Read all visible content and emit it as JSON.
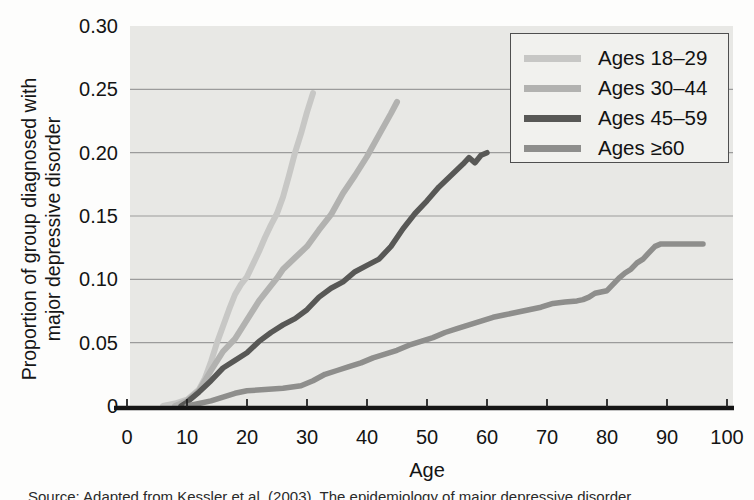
{
  "figure": {
    "y_axis_title_line1": "Proportion of group diagnosed with",
    "y_axis_title_line2": "major depressive disorder",
    "x_axis_title": "Age",
    "caption": "Source: Adapted from Kessler et al. (2003). The epidemiology of major depressive disorder."
  },
  "chart_data": {
    "type": "line",
    "title": "",
    "xlabel": "Age",
    "ylabel": "Proportion of group diagnosed with major depressive disorder",
    "xlim": [
      0,
      100
    ],
    "ylim": [
      0,
      0.3
    ],
    "x_ticks": [
      0,
      10,
      20,
      30,
      40,
      50,
      60,
      70,
      80,
      90,
      100
    ],
    "x_tick_labels": [
      "0",
      "10",
      "20",
      "30",
      "40",
      "50",
      "60",
      "70",
      "80",
      "90",
      "100"
    ],
    "y_ticks": [
      0,
      0.05,
      0.1,
      0.15,
      0.2,
      0.25,
      0.3
    ],
    "y_tick_labels": [
      "0",
      "0.05",
      "0.10",
      "0.15",
      "0.20",
      "0.25",
      "0.30"
    ],
    "grid": "horizontal",
    "legend_position": "top-right",
    "colors": {
      "plot_bg": "#e8e8e5",
      "grid": "#9b9b9b",
      "axis": "#151515",
      "tick": "#222222"
    },
    "series": [
      {
        "name": "Ages 18–29",
        "color": "#c7c7c5",
        "stroke_width": 6,
        "points": [
          [
            6,
            0
          ],
          [
            8,
            0.002
          ],
          [
            10,
            0.005
          ],
          [
            12,
            0.013
          ],
          [
            13,
            0.022
          ],
          [
            14,
            0.035
          ],
          [
            15,
            0.05
          ],
          [
            16,
            0.063
          ],
          [
            17,
            0.076
          ],
          [
            18,
            0.088
          ],
          [
            19,
            0.096
          ],
          [
            20,
            0.102
          ],
          [
            21,
            0.112
          ],
          [
            22,
            0.122
          ],
          [
            23,
            0.133
          ],
          [
            24,
            0.143
          ],
          [
            25,
            0.152
          ],
          [
            26,
            0.165
          ],
          [
            27,
            0.182
          ],
          [
            28,
            0.2
          ],
          [
            29,
            0.215
          ],
          [
            30,
            0.232
          ],
          [
            31,
            0.247
          ]
        ]
      },
      {
        "name": "Ages 30–44",
        "color": "#b2b2b0",
        "stroke_width": 6,
        "points": [
          [
            8,
            0
          ],
          [
            10,
            0.004
          ],
          [
            12,
            0.012
          ],
          [
            14,
            0.028
          ],
          [
            16,
            0.043
          ],
          [
            18,
            0.053
          ],
          [
            20,
            0.068
          ],
          [
            22,
            0.083
          ],
          [
            24,
            0.095
          ],
          [
            25,
            0.101
          ],
          [
            26,
            0.108
          ],
          [
            28,
            0.117
          ],
          [
            30,
            0.126
          ],
          [
            32,
            0.139
          ],
          [
            34,
            0.151
          ],
          [
            36,
            0.168
          ],
          [
            38,
            0.182
          ],
          [
            40,
            0.197
          ],
          [
            42,
            0.214
          ],
          [
            44,
            0.231
          ],
          [
            45,
            0.24
          ]
        ]
      },
      {
        "name": "Ages 45–59",
        "color": "#585856",
        "stroke_width": 5.5,
        "points": [
          [
            9,
            0
          ],
          [
            10,
            0.003
          ],
          [
            12,
            0.011
          ],
          [
            14,
            0.02
          ],
          [
            16,
            0.03
          ],
          [
            18,
            0.036
          ],
          [
            20,
            0.042
          ],
          [
            22,
            0.051
          ],
          [
            24,
            0.058
          ],
          [
            26,
            0.064
          ],
          [
            28,
            0.069
          ],
          [
            30,
            0.076
          ],
          [
            32,
            0.086
          ],
          [
            34,
            0.093
          ],
          [
            36,
            0.098
          ],
          [
            38,
            0.106
          ],
          [
            40,
            0.111
          ],
          [
            42,
            0.116
          ],
          [
            44,
            0.126
          ],
          [
            46,
            0.14
          ],
          [
            48,
            0.152
          ],
          [
            50,
            0.162
          ],
          [
            52,
            0.173
          ],
          [
            54,
            0.182
          ],
          [
            56,
            0.191
          ],
          [
            57,
            0.196
          ],
          [
            58,
            0.192
          ],
          [
            59,
            0.198
          ],
          [
            60,
            0.2
          ]
        ]
      },
      {
        "name": "Ages ≥60",
        "color": "#8e8e8c",
        "stroke_width": 5.5,
        "points": [
          [
            10,
            0
          ],
          [
            12,
            0.002
          ],
          [
            14,
            0.004
          ],
          [
            16,
            0.007
          ],
          [
            18,
            0.01
          ],
          [
            20,
            0.012
          ],
          [
            23,
            0.013
          ],
          [
            26,
            0.014
          ],
          [
            29,
            0.016
          ],
          [
            31,
            0.02
          ],
          [
            33,
            0.025
          ],
          [
            35,
            0.028
          ],
          [
            37,
            0.031
          ],
          [
            39,
            0.034
          ],
          [
            41,
            0.038
          ],
          [
            43,
            0.041
          ],
          [
            45,
            0.044
          ],
          [
            47,
            0.048
          ],
          [
            49,
            0.051
          ],
          [
            51,
            0.054
          ],
          [
            53,
            0.058
          ],
          [
            55,
            0.061
          ],
          [
            57,
            0.064
          ],
          [
            59,
            0.067
          ],
          [
            61,
            0.07
          ],
          [
            63,
            0.072
          ],
          [
            65,
            0.074
          ],
          [
            67,
            0.076
          ],
          [
            69,
            0.078
          ],
          [
            71,
            0.081
          ],
          [
            73,
            0.082
          ],
          [
            75,
            0.083
          ],
          [
            76,
            0.084
          ],
          [
            77,
            0.086
          ],
          [
            78,
            0.089
          ],
          [
            79,
            0.09
          ],
          [
            80,
            0.091
          ],
          [
            81,
            0.096
          ],
          [
            82,
            0.101
          ],
          [
            83,
            0.105
          ],
          [
            84,
            0.108
          ],
          [
            85,
            0.113
          ],
          [
            86,
            0.116
          ],
          [
            87,
            0.121
          ],
          [
            88,
            0.126
          ],
          [
            89,
            0.128
          ],
          [
            91,
            0.128
          ],
          [
            93,
            0.128
          ],
          [
            95,
            0.128
          ],
          [
            96,
            0.128
          ]
        ]
      }
    ]
  }
}
